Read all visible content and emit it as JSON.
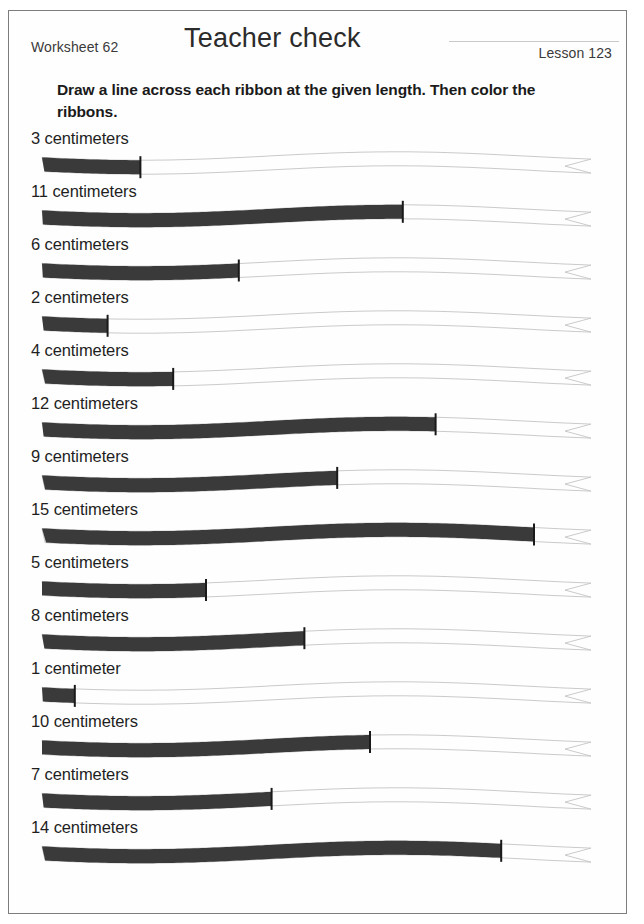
{
  "header": {
    "worksheet_label": "Worksheet 62",
    "title": "Teacher check",
    "lesson_label": "Lesson 123"
  },
  "instructions": "Draw a line across each ribbon at the given length.  Then color the ribbons.",
  "colors": {
    "page_border": "#7d7d7d",
    "ribbon_fill": "#3a3a3a",
    "ribbon_outline": "#c4c4c4",
    "tick_mark": "#1a1a1a",
    "text": "#1f1f1f",
    "signature_line": "#c9c9c9"
  },
  "scale": {
    "pixels_per_cm": 32.8,
    "ribbon_start_x": 11,
    "unit": "centimeters"
  },
  "rows": [
    {
      "label": "3 centimeters",
      "value": 3,
      "unit": "centimeters"
    },
    {
      "label": "11 centimeters",
      "value": 11,
      "unit": "centimeters"
    },
    {
      "label": "6 centimeters",
      "value": 6,
      "unit": "centimeters"
    },
    {
      "label": "2 centimeters",
      "value": 2,
      "unit": "centimeters"
    },
    {
      "label": "4 centimeters",
      "value": 4,
      "unit": "centimeters"
    },
    {
      "label": "12 centimeters",
      "value": 12,
      "unit": "centimeters"
    },
    {
      "label": "9 centimeters",
      "value": 9,
      "unit": "centimeters"
    },
    {
      "label": "15 centimeters",
      "value": 15,
      "unit": "centimeters"
    },
    {
      "label": "5 centimeters",
      "value": 5,
      "unit": "centimeters"
    },
    {
      "label": "8 centimeters",
      "value": 8,
      "unit": "centimeters"
    },
    {
      "label": "1 centimeter",
      "value": 1,
      "unit": "centimeter"
    },
    {
      "label": "10 centimeters",
      "value": 10,
      "unit": "centimeters"
    },
    {
      "label": "7 centimeters",
      "value": 7,
      "unit": "centimeters"
    },
    {
      "label": "14 centimeters",
      "value": 14,
      "unit": "centimeters"
    }
  ]
}
